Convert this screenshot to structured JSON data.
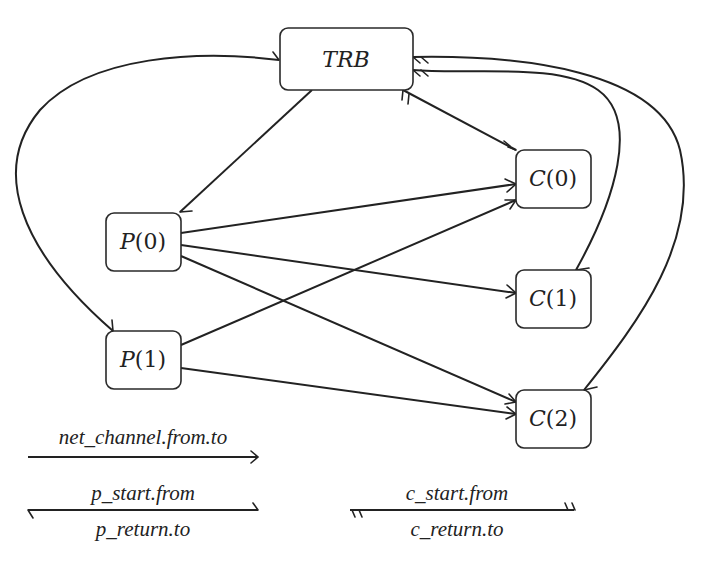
{
  "diagram": {
    "title_fragment": "",
    "nodes": [
      {
        "id": "TRB",
        "label_main": "TRB",
        "label_arg": "",
        "x": 280,
        "y": 28,
        "w": 133,
        "h": 62,
        "italic_main": true
      },
      {
        "id": "P0",
        "label_main": "P",
        "label_arg": "(0)",
        "x": 106,
        "y": 213,
        "w": 75,
        "h": 58
      },
      {
        "id": "P1",
        "label_main": "P",
        "label_arg": "(1)",
        "x": 106,
        "y": 331,
        "w": 75,
        "h": 58
      },
      {
        "id": "C0",
        "label_main": "C",
        "label_arg": "(0)",
        "x": 516,
        "y": 150,
        "w": 75,
        "h": 58
      },
      {
        "id": "C1",
        "label_main": "C",
        "label_arg": "(1)",
        "x": 516,
        "y": 270,
        "w": 75,
        "h": 58
      },
      {
        "id": "C2",
        "label_main": "C",
        "label_arg": "(2)",
        "x": 516,
        "y": 390,
        "w": 75,
        "h": 58
      }
    ],
    "edges": [
      {
        "from": "TRB",
        "to": "P0",
        "kind": "p_start.from"
      },
      {
        "from": "P1",
        "to": "TRB",
        "kind": "p_return.to"
      },
      {
        "from": "TRB",
        "to": "P1",
        "kind": "p_start.from"
      },
      {
        "from": "TRB",
        "to": "C0",
        "kind": "c_start.from"
      },
      {
        "from": "C1",
        "to": "TRB",
        "kind": "c_return.to"
      },
      {
        "from": "C2",
        "to": "TRB",
        "kind": "c_return.to"
      },
      {
        "from": "P0",
        "to": "C0",
        "kind": "net_channel.from.to"
      },
      {
        "from": "P0",
        "to": "C1",
        "kind": "net_channel.from.to"
      },
      {
        "from": "P0",
        "to": "C2",
        "kind": "net_channel.from.to"
      },
      {
        "from": "P1",
        "to": "C0",
        "kind": "net_channel.from.to"
      },
      {
        "from": "P1",
        "to": "C2",
        "kind": "net_channel.from.to"
      }
    ]
  },
  "legend": {
    "net_channel": "net_channel.from.to",
    "p_start": "p_start.from",
    "p_return": "p_return.to",
    "c_start": "c_start.from",
    "c_return": "c_return.to"
  }
}
